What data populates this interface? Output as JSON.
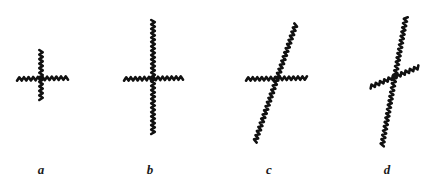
{
  "figure": {
    "width": 437,
    "height": 184,
    "background_color": "#ffffff",
    "stroke_color": "#111111",
    "stroke_style": "hand-drawn-wavy",
    "stroke_width": 2.6
  },
  "panels": [
    {
      "id": "a",
      "label": "a",
      "label_x": 41,
      "label_y": 163,
      "strokes": [
        {
          "name": "horizontal-stroke",
          "x1": 17,
          "y1": 79,
          "x2": 68,
          "y2": 78,
          "amplitude": 1.7,
          "wavelength": 4.6
        },
        {
          "name": "vertical-stroke",
          "x1": 41,
          "y1": 50,
          "x2": 41,
          "y2": 100,
          "amplitude": 1.7,
          "wavelength": 4.6
        }
      ]
    },
    {
      "id": "b",
      "label": "b",
      "label_x": 150,
      "label_y": 163,
      "strokes": [
        {
          "name": "horizontal-stroke",
          "x1": 124,
          "y1": 79,
          "x2": 183,
          "y2": 78,
          "amplitude": 1.7,
          "wavelength": 4.6
        },
        {
          "name": "vertical-stroke",
          "x1": 153,
          "y1": 20,
          "x2": 153,
          "y2": 134,
          "amplitude": 1.8,
          "wavelength": 4.4
        }
      ]
    },
    {
      "id": "c",
      "label": "c",
      "label_x": 269,
      "label_y": 163,
      "strokes": [
        {
          "name": "horizontal-stroke",
          "x1": 246,
          "y1": 79,
          "x2": 307,
          "y2": 78,
          "amplitude": 1.7,
          "wavelength": 4.6
        },
        {
          "name": "tilted-stroke",
          "x1": 255,
          "y1": 142,
          "x2": 296,
          "y2": 24,
          "amplitude": 1.8,
          "wavelength": 4.4
        }
      ]
    },
    {
      "id": "d",
      "label": "d",
      "label_x": 387,
      "label_y": 163,
      "strokes": [
        {
          "name": "tilted-crossing-stroke",
          "x1": 370,
          "y1": 87,
          "x2": 419,
          "y2": 67,
          "amplitude": 1.7,
          "wavelength": 4.6
        },
        {
          "name": "steep-tilted-stroke",
          "x1": 382,
          "y1": 146,
          "x2": 406,
          "y2": 17,
          "amplitude": 1.8,
          "wavelength": 4.4
        }
      ]
    }
  ]
}
